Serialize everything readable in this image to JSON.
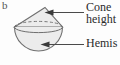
{
  "figure": {
    "part_letter": "b",
    "background_color": "#fdfdfd",
    "solid": {
      "name": "cone-on-hemisphere",
      "fill_color": "#ececec",
      "stroke_color": "#6f6f6f",
      "dashed_joint_color": "#777777"
    },
    "callouts": [
      {
        "name": "cone-height",
        "line1": "Cone",
        "line2": "height",
        "clipped": true,
        "arrow_direction": "left"
      },
      {
        "name": "hemisphere",
        "line1": "Hemis",
        "clipped": true,
        "arrow_direction": "left"
      }
    ]
  }
}
